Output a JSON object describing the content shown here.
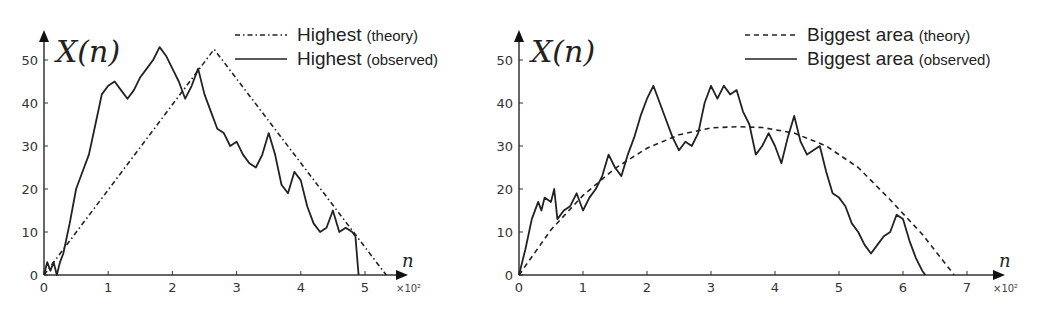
{
  "chart_data": [
    {
      "type": "line",
      "title": "",
      "ylabel": "X(n)",
      "xlabel": "n",
      "x_scale_label": "×10²",
      "xlim": [
        0,
        5.6
      ],
      "ylim": [
        0,
        55
      ],
      "xticks": [
        "0",
        "1",
        "2",
        "3",
        "4",
        "5"
      ],
      "yticks": [
        "0",
        "10",
        "20",
        "30",
        "40",
        "50"
      ],
      "grid": false,
      "legend_position": "upper right",
      "series": [
        {
          "name": "Highest (theory)",
          "legend_main": "Highest",
          "legend_sub": "(theory)",
          "style": "dashdot",
          "x": [
            0,
            2.65,
            5.33
          ],
          "y": [
            0,
            52.5,
            0
          ]
        },
        {
          "name": "Highest (observed)",
          "legend_main": "Highest",
          "legend_sub": "(observed)",
          "style": "solid",
          "x": [
            0,
            0.05,
            0.1,
            0.15,
            0.2,
            0.25,
            0.3,
            0.4,
            0.5,
            0.6,
            0.7,
            0.8,
            0.9,
            1.0,
            1.1,
            1.2,
            1.3,
            1.4,
            1.5,
            1.6,
            1.7,
            1.8,
            1.9,
            2.0,
            2.1,
            2.2,
            2.3,
            2.4,
            2.5,
            2.6,
            2.7,
            2.8,
            2.9,
            3.0,
            3.1,
            3.2,
            3.3,
            3.4,
            3.5,
            3.6,
            3.7,
            3.8,
            3.9,
            4.0,
            4.1,
            4.2,
            4.3,
            4.4,
            4.5,
            4.6,
            4.7,
            4.8,
            4.85,
            4.9
          ],
          "y": [
            0,
            3,
            1,
            3,
            0,
            3,
            5,
            12,
            20,
            24,
            28,
            35,
            42,
            44,
            45,
            43,
            41,
            43,
            46,
            48,
            50,
            53,
            51,
            48,
            45,
            41,
            44,
            48,
            42,
            38,
            34,
            33,
            30,
            31,
            28,
            26,
            25,
            28,
            33,
            28,
            21,
            19,
            24,
            22,
            16,
            12,
            10,
            11,
            15,
            10,
            11,
            10,
            9,
            0
          ]
        }
      ]
    },
    {
      "type": "line",
      "title": "",
      "ylabel": "X(n)",
      "xlabel": "n",
      "x_scale_label": "×10²",
      "xlim": [
        0,
        7.4
      ],
      "ylim": [
        0,
        55
      ],
      "xticks": [
        "0",
        "1",
        "2",
        "3",
        "4",
        "5",
        "6",
        "7"
      ],
      "yticks": [
        "0",
        "10",
        "20",
        "30",
        "40",
        "50"
      ],
      "grid": false,
      "legend_position": "upper right",
      "series": [
        {
          "name": "Biggest area (theory)",
          "legend_main": "Biggest area",
          "legend_sub": "(theory)",
          "style": "dashed",
          "x": [
            0,
            0.5,
            1.0,
            1.5,
            2.0,
            2.5,
            3.0,
            3.4,
            3.8,
            4.3,
            4.8,
            5.3,
            5.8,
            6.3,
            6.8
          ],
          "y": [
            0,
            10.5,
            18.5,
            24.8,
            29.5,
            32.6,
            34.2,
            34.5,
            34.3,
            33.0,
            30.0,
            25.0,
            17.5,
            9.5,
            0
          ]
        },
        {
          "name": "Biggest area (observed)",
          "legend_main": "Biggest area",
          "legend_sub": "(observed)",
          "style": "solid",
          "x": [
            0,
            0.1,
            0.2,
            0.3,
            0.35,
            0.4,
            0.5,
            0.55,
            0.6,
            0.7,
            0.8,
            0.9,
            1.0,
            1.1,
            1.2,
            1.3,
            1.4,
            1.5,
            1.6,
            1.7,
            1.8,
            1.9,
            2.0,
            2.1,
            2.2,
            2.3,
            2.4,
            2.5,
            2.6,
            2.7,
            2.8,
            2.9,
            3.0,
            3.1,
            3.2,
            3.3,
            3.4,
            3.5,
            3.6,
            3.7,
            3.8,
            3.9,
            4.0,
            4.1,
            4.2,
            4.3,
            4.4,
            4.5,
            4.6,
            4.7,
            4.8,
            4.9,
            5.0,
            5.1,
            5.2,
            5.3,
            5.4,
            5.5,
            5.6,
            5.7,
            5.8,
            5.9,
            6.0,
            6.1,
            6.2,
            6.3,
            6.35
          ],
          "y": [
            0,
            6,
            13,
            17,
            15,
            18,
            17,
            20,
            13,
            15,
            16,
            19,
            15,
            18,
            20,
            23,
            28,
            25,
            23,
            28,
            32,
            37,
            41,
            44,
            40,
            36,
            32,
            29,
            31,
            30,
            33,
            40,
            44,
            41,
            44,
            42,
            43,
            38,
            35,
            28,
            30,
            33,
            30,
            26,
            32,
            37,
            31,
            28,
            29,
            30,
            24,
            19,
            18,
            16,
            12,
            10,
            7,
            5,
            7,
            9,
            10,
            14,
            13,
            8,
            4,
            1,
            0
          ]
        }
      ]
    }
  ]
}
